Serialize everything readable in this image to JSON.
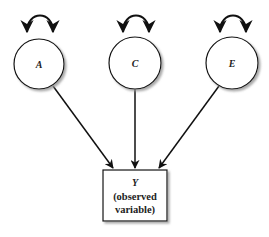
{
  "diagram": {
    "type": "path-diagram",
    "latent_nodes": [
      {
        "id": "A",
        "label": "A"
      },
      {
        "id": "C",
        "label": "C"
      },
      {
        "id": "E",
        "label": "E"
      }
    ],
    "observed_node": {
      "id": "Y",
      "label": "Y",
      "line1": "(observed",
      "line2": "variable)"
    },
    "edges": [
      {
        "from": "A",
        "to": "Y"
      },
      {
        "from": "C",
        "to": "Y"
      },
      {
        "from": "E",
        "to": "Y"
      }
    ],
    "self_loops": [
      "A",
      "C",
      "E"
    ]
  }
}
